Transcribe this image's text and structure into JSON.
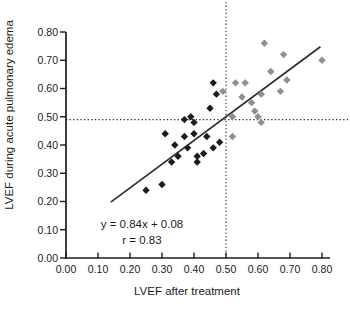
{
  "chart_data": {
    "type": "scatter",
    "title": "",
    "xlabel": "LVEF after treatment",
    "ylabel": "LVEF during acute pulmonary edema",
    "xlim": [
      0,
      0.8
    ],
    "ylim": [
      0,
      0.8
    ],
    "xticks": [
      "0.00",
      "0.10",
      "0.20",
      "0.30",
      "0.40",
      "0.50",
      "0.60",
      "0.70",
      "0.80"
    ],
    "yticks": [
      "0.00",
      "0.10",
      "0.20",
      "0.30",
      "0.40",
      "0.50",
      "0.60",
      "0.70",
      "0.80"
    ],
    "grid": false,
    "legend_position": "none",
    "marker": "diamond",
    "series": [
      {
        "name": "black-diamonds",
        "color": "#1c1c1c",
        "points": [
          [
            0.46,
            0.62
          ],
          [
            0.47,
            0.58
          ],
          [
            0.45,
            0.53
          ],
          [
            0.39,
            0.5
          ],
          [
            0.37,
            0.49
          ],
          [
            0.4,
            0.48
          ],
          [
            0.31,
            0.44
          ],
          [
            0.37,
            0.43
          ],
          [
            0.4,
            0.44
          ],
          [
            0.44,
            0.43
          ],
          [
            0.48,
            0.41
          ],
          [
            0.34,
            0.4
          ],
          [
            0.38,
            0.39
          ],
          [
            0.46,
            0.39
          ],
          [
            0.43,
            0.37
          ],
          [
            0.35,
            0.36
          ],
          [
            0.41,
            0.36
          ],
          [
            0.33,
            0.34
          ],
          [
            0.41,
            0.34
          ],
          [
            0.3,
            0.26
          ],
          [
            0.25,
            0.24
          ]
        ]
      },
      {
        "name": "gray-diamonds",
        "color": "#8f8f8f",
        "points": [
          [
            0.49,
            0.59
          ],
          [
            0.52,
            0.5
          ],
          [
            0.52,
            0.43
          ],
          [
            0.53,
            0.62
          ],
          [
            0.56,
            0.62
          ],
          [
            0.55,
            0.57
          ],
          [
            0.58,
            0.55
          ],
          [
            0.59,
            0.52
          ],
          [
            0.6,
            0.5
          ],
          [
            0.61,
            0.48
          ],
          [
            0.61,
            0.58
          ],
          [
            0.67,
            0.59
          ],
          [
            0.62,
            0.76
          ],
          [
            0.64,
            0.66
          ],
          [
            0.68,
            0.72
          ],
          [
            0.69,
            0.63
          ],
          [
            0.8,
            0.7
          ]
        ]
      }
    ],
    "reference_lines": {
      "vertical_x": 0.5,
      "horizontal_y": 0.49,
      "style": "dotted"
    },
    "regression": {
      "equation": "y = 0.84x + 0.08",
      "r_label": "r = 0.83",
      "slope": 0.84,
      "intercept": 0.08,
      "x_start": 0.14,
      "x_end": 0.795
    }
  }
}
